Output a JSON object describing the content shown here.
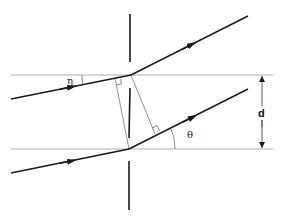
{
  "diagram": {
    "title": "",
    "labels": {
      "incident_angle": "η",
      "diffraction_angle": "θ",
      "slit_spacing": "d"
    },
    "colors": {
      "ray": "#1a1a1a",
      "guide": "#9a9a9a",
      "barrier": "#1a1a1a",
      "background": "#ffffff"
    },
    "elements": {
      "barrier_segments": [
        {
          "x": 130,
          "y1": 14,
          "y2": 62
        },
        {
          "x": 130,
          "y1": 88,
          "y2": 138
        },
        {
          "x": 130,
          "y1": 161,
          "y2": 210
        }
      ],
      "reference_lines": [
        {
          "x1": 11,
          "y1": 75,
          "x2": 273,
          "y2": 75
        },
        {
          "x1": 11,
          "y1": 149,
          "x2": 273,
          "y2": 149
        }
      ],
      "rays": [
        {
          "name": "upper-incident-ray",
          "x1": 11,
          "y1": 99,
          "x2": 131,
          "y2": 75
        },
        {
          "name": "upper-diffracted-ray",
          "x1": 131,
          "y1": 75,
          "x2": 248,
          "y2": 16
        },
        {
          "name": "lower-incident-ray",
          "x1": 11,
          "y1": 173,
          "x2": 129,
          "y2": 149
        },
        {
          "name": "lower-diffracted-ray",
          "x1": 129,
          "y1": 149,
          "x2": 248,
          "y2": 89
        }
      ],
      "perpendiculars": [
        {
          "name": "incident-path-difference-line",
          "x1": 129,
          "y1": 149,
          "x2": 115,
          "y2": 78
        },
        {
          "name": "diffracted-path-difference-line",
          "x1": 131,
          "y1": 75,
          "x2": 155,
          "y2": 134
        }
      ]
    }
  }
}
